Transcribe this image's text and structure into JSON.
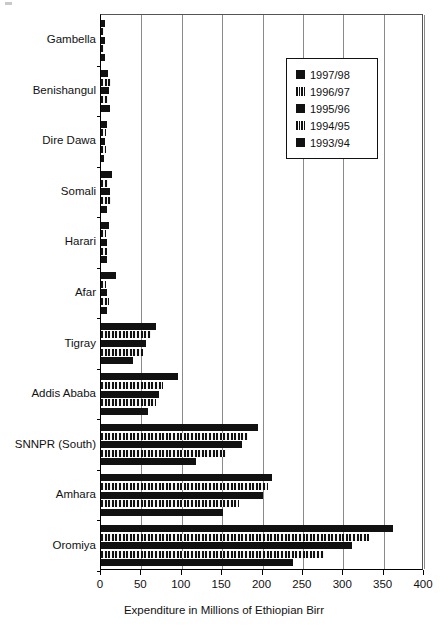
{
  "chart_data": {
    "type": "bar",
    "orientation": "horizontal",
    "title": "",
    "xlabel": "Expenditure in Millions of Ethiopian Birr",
    "ylabel": "",
    "xlim": [
      0,
      400
    ],
    "xticks": [
      0,
      50,
      100,
      150,
      200,
      250,
      300,
      350,
      400
    ],
    "grid": true,
    "legend_position": "upper right",
    "categories": [
      "Gambella",
      "Benishangul",
      "Dire Dawa",
      "Somali",
      "Harari",
      "Afar",
      "Tigray",
      "Addis Ababa",
      "SNNPR (South)",
      "Amhara",
      "Oromiya"
    ],
    "series": [
      {
        "name": "1997/98",
        "pattern": "solid",
        "values": [
          5,
          9,
          8,
          14,
          10,
          18,
          68,
          95,
          194,
          212,
          362
        ]
      },
      {
        "name": "1996/97",
        "pattern": "striped",
        "values": [
          4,
          12,
          6,
          9,
          6,
          6,
          62,
          77,
          182,
          207,
          332
        ]
      },
      {
        "name": "1995/96",
        "pattern": "solid",
        "values": [
          5,
          10,
          5,
          11,
          7,
          8,
          56,
          72,
          174,
          200,
          311
        ]
      },
      {
        "name": "1994/95",
        "pattern": "striped",
        "values": [
          4,
          9,
          6,
          13,
          7,
          10,
          52,
          68,
          155,
          171,
          276
        ]
      },
      {
        "name": "1993/94",
        "pattern": "solid",
        "values": [
          5,
          11,
          4,
          8,
          8,
          7,
          40,
          58,
          118,
          151,
          238
        ]
      }
    ]
  },
  "legend": {
    "items": [
      {
        "label": "1997/98",
        "pattern": "solid"
      },
      {
        "label": "1996/97",
        "pattern": "striped"
      },
      {
        "label": "1995/96",
        "pattern": "solid"
      },
      {
        "label": "1994/95",
        "pattern": "striped"
      },
      {
        "label": "1993/94",
        "pattern": "solid"
      }
    ]
  },
  "colors": {
    "bar": "#111111",
    "grid": "#8a8a8a",
    "axis": "#000000",
    "background": "#ffffff"
  }
}
